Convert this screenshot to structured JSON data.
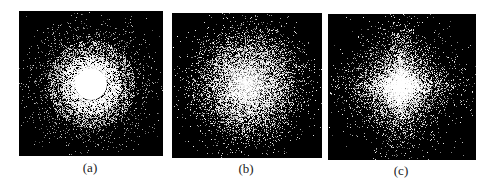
{
  "figure": {
    "panels": [
      {
        "id": "a",
        "label": "(a)",
        "pattern": "concentric-rings",
        "description": "Point cloud with bright solid core, dense inner ring, and sparse outer halo"
      },
      {
        "id": "b",
        "label": "(b)",
        "pattern": "isotropic-gaussian",
        "description": "Circular Gaussian point cloud, bright center fading outward"
      },
      {
        "id": "c",
        "label": "(c)",
        "pattern": "diamond-laplacian",
        "description": "Diamond-shaped (L1) point cloud, bright center with cross-like spread"
      }
    ],
    "colors": {
      "background": "#000000",
      "points": "#ffffff",
      "page": "#ffffff"
    }
  }
}
